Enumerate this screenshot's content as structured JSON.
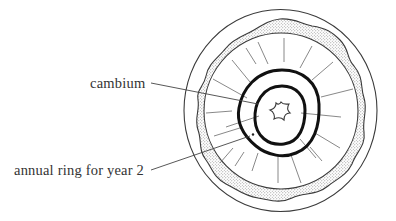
{
  "diagram": {
    "labels": {
      "cambium": "cambium",
      "annual_ring": "annual ring for year 2"
    },
    "parts": [
      {
        "name": "outer-boundary",
        "style": "thin outline circle"
      },
      {
        "name": "bark-band",
        "style": "stippled wavy band"
      },
      {
        "name": "cambium-layer",
        "style": "thin circle inside bark band"
      },
      {
        "name": "annual-ring-year-2",
        "style": "thick black ring (outer)"
      },
      {
        "name": "annual-ring-year-1",
        "style": "thick black ring (inner)"
      },
      {
        "name": "pith",
        "style": "small star-shaped outline at center"
      },
      {
        "name": "medullary-rays",
        "style": "thin radial lines"
      }
    ],
    "colors": {
      "line": "#3a3a3a",
      "ring": "#111111",
      "ray": "#777777",
      "stipple": "#888888",
      "text": "#333333",
      "background": "#ffffff"
    }
  }
}
